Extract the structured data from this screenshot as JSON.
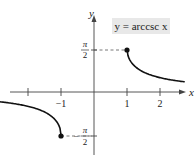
{
  "chart_data": {
    "type": "line",
    "title": "y = arccsc x",
    "xlabel": "x",
    "ylabel": "y",
    "xlim": [
      -2.8,
      2.8
    ],
    "ylim": [
      -2.3,
      2.3
    ],
    "x_ticks": [
      -2,
      -1,
      1,
      2
    ],
    "x_tick_labels": [
      "",
      "−1",
      "1",
      "2"
    ],
    "y_ticks": [
      1.5708,
      -1.5708
    ],
    "y_tick_labels": [
      "π/2",
      "−π/2"
    ],
    "grid": false,
    "legend": null,
    "series": [
      {
        "name": "arccsc x (x ≥ 1)",
        "x": [
          1,
          1.1,
          1.25,
          1.5,
          1.75,
          2,
          2.5
        ],
        "values": [
          1.5708,
          1.1411,
          0.9273,
          0.7297,
          0.6082,
          0.5236,
          0.4115
        ]
      },
      {
        "name": "arccsc x (x ≤ -1)",
        "x": [
          -2.8,
          -2.5,
          -2,
          -1.5,
          -1.25,
          -1.1,
          -1
        ],
        "values": [
          -0.3652,
          -0.4115,
          -0.5236,
          -0.7297,
          -0.9273,
          -1.1411,
          -1.5708
        ]
      }
    ],
    "annotations": [
      {
        "type": "point",
        "x": 1,
        "y": 1.5708,
        "label": "closed endpoint"
      },
      {
        "type": "point",
        "x": -1,
        "y": -1.5708,
        "label": "closed endpoint"
      },
      {
        "type": "dashed-guide",
        "from": [
          0,
          1.5708
        ],
        "to": [
          1,
          1.5708
        ]
      },
      {
        "type": "dashed-guide",
        "from": [
          0,
          -1.5708
        ],
        "to": [
          -1,
          -1.5708
        ]
      }
    ]
  },
  "labels": {
    "equation": "y = arccsc x",
    "x_axis": "x",
    "y_axis": "y",
    "tick_neg1": "−1",
    "tick_1": "1",
    "tick_2": "2",
    "pi": "π",
    "two": "2",
    "minus": "−"
  }
}
